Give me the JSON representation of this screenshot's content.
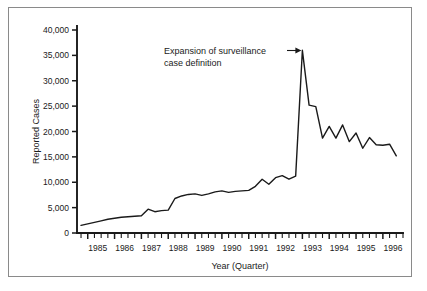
{
  "chart_data": {
    "type": "line",
    "title": "",
    "xlabel": "Year (Quarter)",
    "ylabel": "Reported Cases",
    "ylim": [
      0,
      40000
    ],
    "ytick_labels": [
      "0",
      "5,000",
      "10,000",
      "15,000",
      "20,000",
      "25,000",
      "30,000",
      "35,000",
      "40,000"
    ],
    "ytick_values": [
      0,
      5000,
      10000,
      15000,
      20000,
      25000,
      30000,
      35000,
      40000
    ],
    "xtick_labels": [
      "1985",
      "1986",
      "1987",
      "1988",
      "1989",
      "1990",
      "1991",
      "1992",
      "1993",
      "1994",
      "1995",
      "1996"
    ],
    "xtick_values": [
      1985,
      1986,
      1987,
      1988,
      1989,
      1990,
      1991,
      1992,
      1993,
      1994,
      1995,
      1996
    ],
    "x_minor_per_major": 4,
    "grid": false,
    "legend": null,
    "annotations": [
      {
        "text_line1": "Expansion of surveillance",
        "text_line2": "case definition",
        "points_to_x": 1993.0,
        "points_to_y": 36000
      }
    ],
    "x": [
      1984.75,
      1985.0,
      1985.25,
      1985.5,
      1985.75,
      1986.0,
      1986.25,
      1986.5,
      1986.75,
      1987.0,
      1987.25,
      1987.5,
      1987.75,
      1988.0,
      1988.25,
      1988.5,
      1988.75,
      1989.0,
      1989.25,
      1989.5,
      1989.75,
      1990.0,
      1990.25,
      1990.5,
      1990.75,
      1991.0,
      1991.25,
      1991.5,
      1991.75,
      1992.0,
      1992.25,
      1992.5,
      1992.75,
      1993.0,
      1993.25,
      1993.5,
      1993.75,
      1994.0,
      1994.25,
      1994.5,
      1994.75,
      1995.0,
      1995.25,
      1995.5,
      1995.75,
      1996.0,
      1996.25,
      1996.5
    ],
    "values": [
      1500,
      1800,
      2100,
      2400,
      2700,
      2900,
      3100,
      3200,
      3300,
      3400,
      4700,
      4200,
      4400,
      4500,
      6800,
      7300,
      7600,
      7700,
      7400,
      7700,
      8100,
      8300,
      8000,
      8200,
      8300,
      8400,
      9200,
      10600,
      9600,
      10900,
      11300,
      10600,
      11200,
      36000,
      25200,
      24900,
      18700,
      21000,
      18700,
      21300,
      18000,
      19700,
      16700,
      18800,
      17400,
      17300,
      17500,
      15200
    ],
    "series_name": "Reported AIDS cases"
  },
  "figure": {
    "border_color": "#8a8a8a",
    "line_color": "#1a1a1a",
    "background": "#ffffff"
  }
}
